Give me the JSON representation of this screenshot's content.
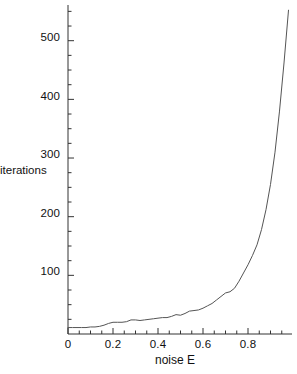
{
  "chart_data": {
    "type": "line",
    "title": "",
    "xlabel": "noise  E",
    "ylabel": "iterations",
    "xlim": [
      0,
      1.0
    ],
    "ylim": [
      0,
      560
    ],
    "grid": false,
    "legend": null,
    "axis_color": "#333333",
    "line_color": "#555555",
    "background": "#ffffff",
    "x_ticks_major": [
      0,
      0.2,
      0.4,
      0.6,
      0.8
    ],
    "x_tick_labels": [
      "0",
      "0.2",
      "0.4",
      "0.6",
      "0.8"
    ],
    "x_ticks_minor": [
      0.05,
      0.1,
      0.15,
      0.25,
      0.3,
      0.35,
      0.45,
      0.5,
      0.55,
      0.65,
      0.7,
      0.75,
      0.85,
      0.9,
      0.95
    ],
    "y_ticks_major": [
      100,
      200,
      300,
      400,
      500
    ],
    "y_tick_labels": [
      "100",
      "200",
      "300",
      "400",
      "500"
    ],
    "y_ticks_minor": [
      25,
      50,
      75,
      125,
      150,
      175,
      225,
      250,
      275,
      325,
      350,
      375,
      425,
      450,
      475,
      525,
      550
    ],
    "series": [
      {
        "name": "iterations vs noise",
        "x": [
          0.0,
          0.02,
          0.04,
          0.06,
          0.08,
          0.1,
          0.12,
          0.14,
          0.16,
          0.18,
          0.2,
          0.22,
          0.24,
          0.26,
          0.28,
          0.3,
          0.32,
          0.34,
          0.36,
          0.38,
          0.4,
          0.42,
          0.44,
          0.46,
          0.48,
          0.5,
          0.52,
          0.54,
          0.56,
          0.58,
          0.6,
          0.62,
          0.64,
          0.66,
          0.68,
          0.7,
          0.72,
          0.74,
          0.76,
          0.78,
          0.8,
          0.82,
          0.84,
          0.86,
          0.88,
          0.9,
          0.92,
          0.94,
          0.96,
          0.98
        ],
        "y": [
          11,
          11,
          11,
          11,
          11,
          12,
          12,
          13,
          15,
          18,
          20,
          20,
          20,
          21,
          24,
          24,
          23,
          24,
          25,
          26,
          27,
          28,
          28,
          30,
          33,
          32,
          35,
          39,
          40,
          41,
          44,
          48,
          52,
          58,
          64,
          70,
          72,
          78,
          90,
          104,
          118,
          134,
          152,
          178,
          212,
          255,
          310,
          380,
          462,
          552
        ]
      }
    ]
  },
  "axes": {
    "y_axis_name": "y-axis",
    "x_axis_name": "x-axis"
  }
}
